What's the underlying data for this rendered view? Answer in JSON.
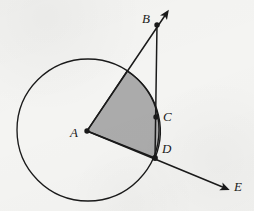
{
  "figure": {
    "background_color": "#f4f4f2",
    "stroke_color": "#1a1a1a",
    "sector_fill_color": "#a8a8a8",
    "circle": {
      "center_label": "A",
      "center": {
        "x": 88,
        "y": 130
      },
      "radius": 71
    },
    "points": [
      {
        "label": "A",
        "role": "circle-center",
        "x": 87,
        "y": 131,
        "label_x": 70,
        "label_y": 126,
        "dot": true
      },
      {
        "label": "B",
        "role": "ray-endpoint-outside",
        "x": 157,
        "y": 25,
        "label_x": 142,
        "label_y": 12,
        "dot": true
      },
      {
        "label": "C",
        "role": "point-on-segment-inside",
        "x": 156,
        "y": 117,
        "label_x": 163,
        "label_y": 110,
        "dot": true
      },
      {
        "label": "D",
        "role": "point-on-circle",
        "x": 155,
        "y": 158,
        "label_x": 162,
        "label_y": 142,
        "dot": true
      },
      {
        "label": "E",
        "role": "ray-arrow-endpoint",
        "x": 228,
        "y": 190,
        "label_x": 234,
        "label_y": 180,
        "dot": false
      }
    ],
    "segments": [
      {
        "name": "ray-A-to-B",
        "from": "A",
        "to": "B",
        "x1": 87,
        "y1": 131,
        "x2": 168,
        "y2": 11,
        "arrow": true
      },
      {
        "name": "ray-A-to-E",
        "from": "A",
        "to": "E",
        "x1": 87,
        "y1": 131,
        "x2": 230,
        "y2": 190,
        "arrow": true
      },
      {
        "name": "segment-B-to-D",
        "from": "B",
        "to": "D",
        "x1": 157,
        "y1": 25,
        "x2": 155,
        "y2": 159,
        "arrow": false
      }
    ],
    "sector": {
      "name": "shaded-sector-A",
      "vertex": "A",
      "arc_start": {
        "x": 127,
        "y": 71
      },
      "arc_end": {
        "x": 155,
        "y": 158
      },
      "radius": 71,
      "fill": "#a8a8a8"
    },
    "labels": {
      "a": "A",
      "b": "B",
      "c": "C",
      "d": "D",
      "e": "E"
    }
  }
}
